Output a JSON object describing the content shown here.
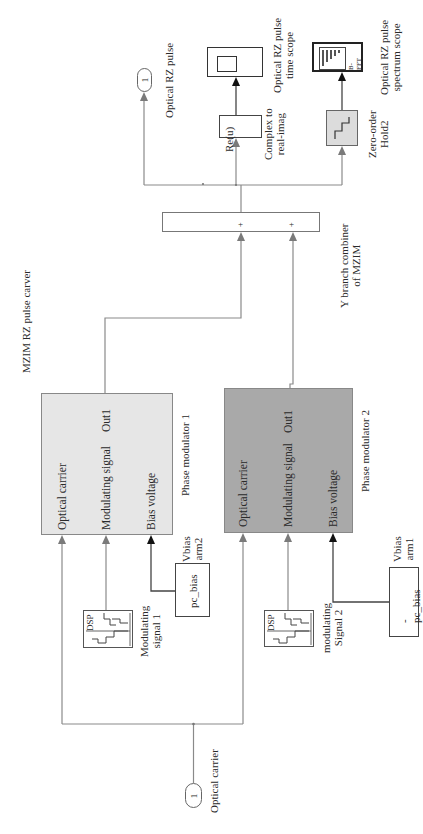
{
  "diagram": {
    "title": "MZIM RZ pulse carver",
    "inport": {
      "number": "1",
      "label": "Optical carrier"
    },
    "outport": {
      "number": "1",
      "label": "Optical RZ pulse"
    },
    "phase_modulator_1": {
      "name": "Phase modulator 1",
      "ports_in": [
        "Optical carrier",
        "Modulating signal",
        "Bias voltage"
      ],
      "port_out": "Out1",
      "color": "#e6e6e6"
    },
    "phase_modulator_2": {
      "name": "Phase modulator 2",
      "ports_in": [
        "Optical carrier",
        "Modulating signal",
        "Bias voltage"
      ],
      "port_out": "Out1",
      "color": "#a9a9a9"
    },
    "modulating_signal_1": {
      "icon_text": "DSP",
      "label": "Modulating\nsignal 1"
    },
    "modulating_signal_2": {
      "icon_text": "DSP",
      "label": "modulating\nSignal 2"
    },
    "vbias_arm2": {
      "value": "pc_bias",
      "label": "Vbias\narm2"
    },
    "vbias_arm1": {
      "value": "-pc_bias",
      "label": "Vbias\narm1"
    },
    "combiner": {
      "label": "Y branch combiner\nof MZIM",
      "signs": [
        "+",
        "+"
      ]
    },
    "complex_to_real": {
      "text": "Re(u)",
      "label": "Complex to\nreal-imag"
    },
    "time_scope": {
      "label": "Optical RZ pulse\ntime scope"
    },
    "zero_order_hold": {
      "label": "Zero-order\nHold2"
    },
    "spectrum_scope": {
      "text": "B-FFT",
      "label": "Optical RZ pulse\nspectrum scope"
    }
  }
}
